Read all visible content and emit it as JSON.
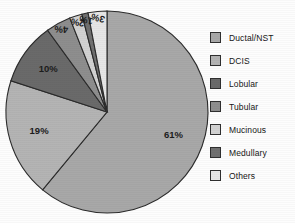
{
  "chart_data": {
    "type": "pie",
    "title": "",
    "subtitle": "",
    "xlabel": "",
    "ylabel": "",
    "legend_position": "right",
    "grid": false,
    "start_angle_deg": 0,
    "direction": "clockwise",
    "categories": [
      "Ductal/NST",
      "DCIS",
      "Lobular",
      "Tubular",
      "Mucinous",
      "Medullary",
      "Others"
    ],
    "values": [
      61,
      19,
      10,
      4,
      2,
      1,
      3
    ],
    "value_unit": "%",
    "data_labels": [
      "61%",
      "19%",
      "10%",
      "4%",
      "2%",
      "1%",
      "3%"
    ],
    "colors": [
      "#a8a8a8",
      "#b4b4b4",
      "#6a6a6a",
      "#8e8e8e",
      "#d2d2d2",
      "#707070",
      "#e6e6e6"
    ],
    "slices": [
      {
        "label": "Ductal/NST",
        "value": 61,
        "data_label": "61%",
        "color": "#a8a8a8"
      },
      {
        "label": "DCIS",
        "value": 19,
        "data_label": "19%",
        "color": "#b4b4b4"
      },
      {
        "label": "Lobular",
        "value": 10,
        "data_label": "10%",
        "color": "#6a6a6a"
      },
      {
        "label": "Tubular",
        "value": 4,
        "data_label": "4%",
        "color": "#8e8e8e"
      },
      {
        "label": "Mucinous",
        "value": 2,
        "data_label": "2%",
        "color": "#d2d2d2"
      },
      {
        "label": "Medullary",
        "value": 1,
        "data_label": "1%",
        "color": "#707070"
      },
      {
        "label": "Others",
        "value": 3,
        "data_label": "3%",
        "color": "#e6e6e6"
      }
    ]
  },
  "legend": {
    "items": [
      {
        "label": "Ductal/NST",
        "color": "#a8a8a8"
      },
      {
        "label": "DCIS",
        "color": "#b4b4b4"
      },
      {
        "label": "Lobular",
        "color": "#6a6a6a"
      },
      {
        "label": "Tubular",
        "color": "#8e8e8e"
      },
      {
        "label": "Mucinous",
        "color": "#d2d2d2"
      },
      {
        "label": "Medullary",
        "color": "#707070"
      },
      {
        "label": "Others",
        "color": "#e6e6e6"
      }
    ]
  },
  "geometry": {
    "center_x": 107,
    "center_y": 112,
    "radius": 101,
    "label_radius_factor": 0.7
  }
}
